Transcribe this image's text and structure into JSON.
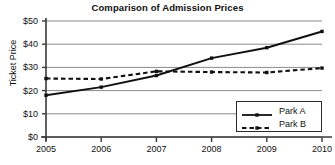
{
  "chart_data": {
    "type": "line",
    "title": "Comparison of Admission Prices",
    "xlabel": "",
    "ylabel": "Ticket Price",
    "categories": [
      "2005",
      "2006",
      "2007",
      "2008",
      "2009",
      "2010"
    ],
    "x": [
      2005,
      2006,
      2007,
      2008,
      2009,
      2010
    ],
    "series": [
      {
        "name": "Park A",
        "style": "solid",
        "marker": "square",
        "color": "#111111",
        "values": [
          18,
          21.5,
          26.5,
          34,
          38.5,
          45.5
        ]
      },
      {
        "name": "Park B",
        "style": "dashed",
        "marker": "square",
        "color": "#111111",
        "values": [
          25.2,
          25,
          28.3,
          28,
          27.8,
          29.7
        ]
      }
    ],
    "ylim": [
      0,
      50
    ],
    "yticks": [
      0,
      10,
      20,
      30,
      40,
      50
    ],
    "ytick_labels": [
      "$0",
      "$10",
      "$20",
      "$30",
      "$40",
      "$50"
    ],
    "xlim": [
      2005,
      2010
    ],
    "grid": "horizontal",
    "legend_position": "bottom-right",
    "legend_entries": [
      "Park A",
      "Park B"
    ]
  },
  "axis": {
    "y_title": "Ticket Price"
  }
}
